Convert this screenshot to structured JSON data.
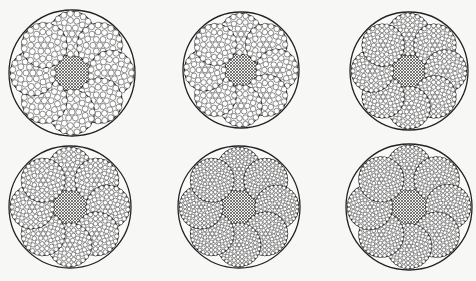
{
  "figure": {
    "background": "#f7f7f5",
    "line_color": "#222222",
    "ropes": [
      {
        "id": "rope-1",
        "cx": 72,
        "cy": 73,
        "r": 63,
        "strands": 8,
        "strand_type": "uniform-wires",
        "wire_rings": 3
      },
      {
        "id": "rope-2",
        "cx": 241,
        "cy": 70,
        "r": 58,
        "strands": 8,
        "strand_type": "seale-centre",
        "wire_rings": 3
      },
      {
        "id": "rope-3",
        "cx": 409,
        "cy": 71,
        "r": 59,
        "strands": 8,
        "strand_type": "filler-wires",
        "wire_rings": 4
      },
      {
        "id": "rope-4",
        "cx": 70,
        "cy": 207,
        "r": 61,
        "strands": 8,
        "strand_type": "warrington",
        "wire_rings": 4
      },
      {
        "id": "rope-5",
        "cx": 239,
        "cy": 207,
        "r": 61,
        "strands": 8,
        "strand_type": "warrington-seale",
        "wire_rings": 5
      },
      {
        "id": "rope-6",
        "cx": 409,
        "cy": 207,
        "r": 63,
        "strands": 8,
        "strand_type": "many-wires",
        "wire_rings": 5
      }
    ]
  }
}
